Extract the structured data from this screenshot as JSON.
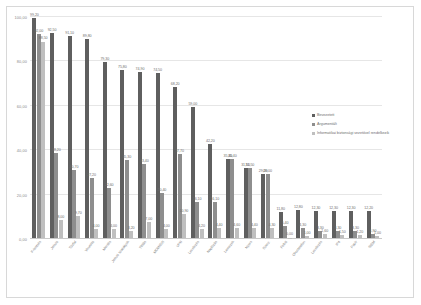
{
  "chart_data": {
    "type": "bar",
    "title": "",
    "xlabel": "",
    "ylabel": "",
    "ylim": [
      0,
      100
    ],
    "yticks": [
      "0,00",
      "20,00",
      "40,00",
      "60,00",
      "80,00",
      "100,00"
    ],
    "ytick_values": [
      0,
      20,
      40,
      60,
      80,
      100
    ],
    "grid": true,
    "legend_position": "right",
    "categories": [
      "F-testsés",
      "Jelszó",
      "Tűzfal",
      "Vírusirtó",
      "Mentés",
      "Jelszó szabályok",
      "Titítás",
      "MDM/IDS",
      "VPN",
      "Levelezés",
      "Naplózás",
      "Lemezek",
      "Nyers",
      "Szerz.",
      "Felhő",
      "Okostelefon",
      "Levelezés",
      "IP4",
      "Papír",
      "SIEM"
    ],
    "series": [
      {
        "name": "Bevezetett",
        "color": "#5f5f5f",
        "values": [
          99.2,
          92.5,
          91.1,
          89.8,
          79.3,
          75.8,
          74.9,
          74.5,
          68.2,
          59.0,
          42.2,
          35.4,
          31.5,
          29.0,
          11.8,
          12.8,
          12.3,
          12.3,
          12.3,
          12.2
        ],
        "labels": [
          "99,20",
          "92,50",
          "91,10",
          "89,80",
          "79,30",
          "75,80",
          "74,90",
          "74,50",
          "68,20",
          "59,00",
          "42,20",
          "35,40",
          "31,50",
          "29,00",
          "11,80",
          "12,80",
          "12,30",
          "12,30",
          "12,30",
          "12,20"
        ]
      },
      {
        "name": "Argumentált",
        "color": "#8e8e8e",
        "values": [
          92.0,
          38.2,
          30.7,
          27.2,
          22.6,
          35.3,
          33.4,
          20.4,
          37.7,
          16.1,
          16.1,
          35.4,
          31.5,
          29.0,
          5.4,
          4.3,
          3.3,
          3.3,
          3.3,
          1.9
        ],
        "labels": [
          "92,00",
          "38,20",
          "30,70",
          "27,20",
          "22,60",
          "35,30",
          "33,40",
          "20,40",
          "37,70",
          "16,10",
          "16,10",
          "35,40",
          "31,50",
          "29,00",
          "5,40",
          "4,30",
          "3,30",
          "3,30",
          "3,30",
          "1,90"
        ]
      },
      {
        "name": "Informatikai biztonsági vezetővel rendelkezik",
        "color": "#bfbfbf",
        "values": [
          88.5,
          8.0,
          9.7,
          4.0,
          4.0,
          3.2,
          7.0,
          4.0,
          10.9,
          4.2,
          4.4,
          4.6,
          4.4,
          4.3,
          0.0,
          1.0,
          1.6,
          1.5,
          1.2,
          1.0
        ],
        "labels": [
          "88,50",
          "8,00",
          "9,70",
          "4,00",
          "4,00",
          "3,20",
          "7,00",
          "4,00",
          "10,90",
          "4,20",
          "4,40",
          "4,60",
          "4,40",
          "4,30",
          "0,00",
          "1,00",
          "1,60",
          "1,50",
          "1,20",
          "1,00"
        ]
      }
    ]
  },
  "legend": {
    "items": [
      {
        "label": "Bevezetett"
      },
      {
        "label": "Argumentált"
      },
      {
        "label": "Informatikai biztonsági vezetővel rendelkezik"
      }
    ]
  }
}
